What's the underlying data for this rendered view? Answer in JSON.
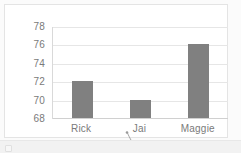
{
  "chart_data": {
    "type": "bar",
    "title": "",
    "subtitle": "",
    "xlabel": "",
    "ylabel": "",
    "categories": [
      "Rick",
      "Jai",
      "Maggie"
    ],
    "values": [
      72,
      70,
      76
    ],
    "series": [
      {
        "name": "",
        "values": [
          72,
          70,
          76
        ]
      }
    ],
    "ylim": [
      68,
      78
    ],
    "ytick_values": [
      78,
      76,
      74,
      72,
      70,
      68
    ],
    "ytick_labels": [
      "78",
      "76",
      "74",
      "72",
      "70",
      "68"
    ],
    "ytick_step": 2,
    "grid": true,
    "grid_axis": "y",
    "legend": false,
    "legend_position": "none",
    "bar_color": "#808080",
    "gridline_color": "#e6e6e6",
    "axis_color": "#d9d9d9",
    "tick_label_color": "#7a7a7a",
    "plot_background": "#ffffff"
  },
  "annotation": {
    "leader_line": {
      "name": "leader-line",
      "anchor_category": "Jai",
      "color": "#9a9a9a"
    }
  },
  "page": {
    "background": "#fbfbfb",
    "panel_background": "#ffffff",
    "panel_border": "#e4e4e4",
    "footer_background": "#f2f2f2"
  }
}
